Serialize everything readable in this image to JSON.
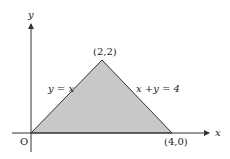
{
  "diagram": {
    "type": "region-plot",
    "axes": {
      "x_label": "x",
      "y_label": "y",
      "origin_label": "O"
    },
    "region": {
      "vertices": [
        [
          0,
          0
        ],
        [
          2,
          2
        ],
        [
          4,
          0
        ]
      ],
      "fill": "#c8c8c8",
      "stroke": "#333333"
    },
    "labels": {
      "apex": "(2,2)",
      "right_vertex": "(4,0)",
      "left_edge": "y = x",
      "right_edge": "x +y = 4"
    }
  }
}
